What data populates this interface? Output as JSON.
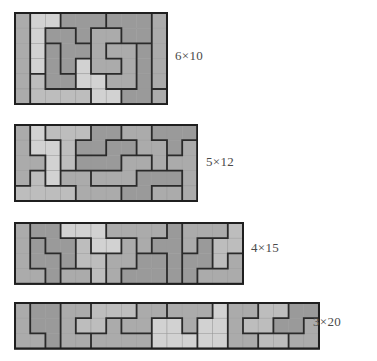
{
  "figure": {
    "title_visible": false,
    "background_color": "#ffffff",
    "cell_size": 15.2,
    "grid_line_color": "#9a9a9a",
    "piece_border_color": "#2a2a2a",
    "frame_color": "#1f1f1f",
    "shades": {
      "light": "#d2d2d2",
      "medium_light": "#bdbdbd",
      "medium": "#ababab",
      "dark": "#9a9a9a"
    }
  },
  "tilings": [
    {
      "id": "tiling-6x10",
      "label": "6×10",
      "rows": 6,
      "cols": 10,
      "x": 14,
      "y": 12,
      "label_x": 175,
      "label_y": 56,
      "cells": [
        [
          "A",
          "B",
          "B",
          "C",
          "C",
          "C",
          "D",
          "D",
          "D",
          "E"
        ],
        [
          "A",
          "B",
          "F",
          "F",
          "C",
          "G",
          "G",
          "D",
          "D",
          "E"
        ],
        [
          "A",
          "B",
          "H",
          "F",
          "F",
          "G",
          "I",
          "I",
          "J",
          "E"
        ],
        [
          "A",
          "B",
          "H",
          "F",
          "K",
          "G",
          "G",
          "I",
          "J",
          "E"
        ],
        [
          "A",
          "L",
          "H",
          "H",
          "K",
          "K",
          "I",
          "I",
          "J",
          "E"
        ],
        [
          "A",
          "L",
          "L",
          "L",
          "L",
          "K",
          "K",
          "J",
          "J",
          "M"
        ]
      ],
      "piece_shades": {
        "A": "medium",
        "B": "light",
        "C": "dark",
        "D": "dark",
        "E": "medium",
        "F": "dark",
        "G": "medium",
        "H": "dark",
        "I": "medium",
        "J": "dark",
        "K": "light",
        "L": "medium_light",
        "M": "medium"
      }
    },
    {
      "id": "tiling-5x12",
      "label": "5×12",
      "rows": 5,
      "cols": 12,
      "x": 14,
      "y": 124,
      "label_x": 206,
      "label_y": 162,
      "cells": [
        [
          "A",
          "B",
          "C",
          "C",
          "C",
          "D",
          "D",
          "E",
          "E",
          "F",
          "F",
          "F"
        ],
        [
          "A",
          "B",
          "B",
          "C",
          "D",
          "D",
          "G",
          "G",
          "E",
          "E",
          "F",
          "H"
        ],
        [
          "A",
          "A",
          "B",
          "C",
          "G",
          "G",
          "G",
          "I",
          "I",
          "E",
          "H",
          "H"
        ],
        [
          "A",
          "J",
          "B",
          "K",
          "K",
          "I",
          "I",
          "I",
          "L",
          "L",
          "L",
          "H"
        ],
        [
          "J",
          "J",
          "J",
          "J",
          "K",
          "K",
          "K",
          "L",
          "L",
          "M",
          "M",
          "H"
        ]
      ],
      "piece_shades": {
        "A": "medium",
        "B": "light",
        "C": "medium_light",
        "D": "dark",
        "E": "medium",
        "F": "dark",
        "G": "dark",
        "H": "medium",
        "I": "medium",
        "J": "medium_light",
        "K": "medium",
        "L": "dark",
        "M": "medium"
      }
    },
    {
      "id": "tiling-4x15",
      "label": "4×15",
      "rows": 4,
      "cols": 15,
      "x": 14,
      "y": 222,
      "label_x": 251,
      "label_y": 248,
      "cells": [
        [
          "A",
          "B",
          "B",
          "C",
          "C",
          "C",
          "D",
          "D",
          "D",
          "D",
          "E",
          "F",
          "F",
          "F",
          "G"
        ],
        [
          "A",
          "H",
          "B",
          "B",
          "I",
          "C",
          "C",
          "J",
          "D",
          "E",
          "E",
          "F",
          "K",
          "G",
          "G"
        ],
        [
          "A",
          "H",
          "H",
          "B",
          "I",
          "I",
          "J",
          "J",
          "L",
          "L",
          "E",
          "K",
          "K",
          "G",
          "M"
        ],
        [
          "A",
          "A",
          "H",
          "N",
          "N",
          "I",
          "J",
          "L",
          "L",
          "L",
          "E",
          "K",
          "M",
          "M",
          "M"
        ]
      ],
      "piece_shades": {
        "A": "medium",
        "B": "dark",
        "C": "light",
        "D": "medium",
        "E": "dark",
        "F": "medium",
        "G": "medium_light",
        "H": "dark",
        "I": "medium_light",
        "J": "medium",
        "K": "dark",
        "L": "dark",
        "M": "medium",
        "N": "medium"
      }
    },
    {
      "id": "tiling-3x20",
      "label": "3×20",
      "rows": 3,
      "cols": 20,
      "x": 14,
      "y": 302,
      "label_x": 313,
      "label_y": 322,
      "cells": [
        [
          "A",
          "B",
          "B",
          "C",
          "C",
          "D",
          "D",
          "D",
          "E",
          "E",
          "F",
          "F",
          "F",
          "G",
          "H",
          "H",
          "I",
          "I",
          "J",
          "J"
        ],
        [
          "A",
          "B",
          "B",
          "C",
          "D",
          "D",
          "K",
          "E",
          "E",
          "L",
          "L",
          "F",
          "G",
          "G",
          "H",
          "I",
          "I",
          "J",
          "J",
          "M"
        ],
        [
          "A",
          "A",
          "B",
          "C",
          "C",
          "K",
          "K",
          "K",
          "K",
          "L",
          "L",
          "L",
          "G",
          "G",
          "H",
          "H",
          "N",
          "N",
          "M",
          "M"
        ]
      ],
      "piece_shades": {
        "A": "medium",
        "B": "dark",
        "C": "medium",
        "D": "medium_light",
        "E": "medium",
        "F": "medium",
        "G": "light",
        "H": "medium",
        "I": "medium_light",
        "J": "dark",
        "K": "medium",
        "L": "light",
        "M": "medium",
        "N": "medium_light"
      }
    }
  ]
}
